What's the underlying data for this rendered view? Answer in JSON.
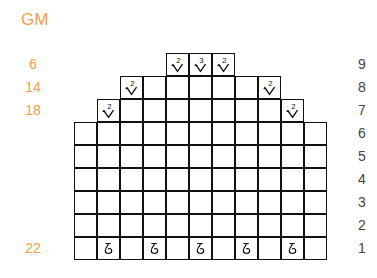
{
  "chart_title": "GM",
  "colors": {
    "label_orange": "#f0a04b",
    "grid": "#111111",
    "row_number": "#444444"
  },
  "grid": {
    "origin_x": 74,
    "bottom_y": 260,
    "cell": 23,
    "rows": [
      {
        "row": 1,
        "start_col": 0,
        "cols": 11,
        "left_count": "22",
        "symbols": {
          "1": "ch-loop",
          "3": "ch-loop",
          "5": "ch-loop",
          "7": "ch-loop",
          "9": "ch-loop"
        }
      },
      {
        "row": 2,
        "start_col": 0,
        "cols": 11,
        "left_count": "",
        "symbols": {}
      },
      {
        "row": 3,
        "start_col": 0,
        "cols": 11,
        "left_count": "",
        "symbols": {}
      },
      {
        "row": 4,
        "start_col": 0,
        "cols": 11,
        "left_count": "",
        "symbols": {}
      },
      {
        "row": 5,
        "start_col": 0,
        "cols": 11,
        "left_count": "",
        "symbols": {}
      },
      {
        "row": 6,
        "start_col": 0,
        "cols": 11,
        "left_count": "",
        "symbols": {}
      },
      {
        "row": 7,
        "start_col": 1,
        "cols": 9,
        "left_count": "18",
        "symbols": {
          "1": "dec-2",
          "9": "dec-2"
        }
      },
      {
        "row": 8,
        "start_col": 2,
        "cols": 7,
        "left_count": "14",
        "symbols": {
          "2": "dec-2",
          "8": "dec-2"
        }
      },
      {
        "row": 9,
        "start_col": 4,
        "cols": 3,
        "left_count": "6",
        "symbols": {
          "4": "dec-2",
          "5": "dec-3",
          "6": "dec-2"
        }
      }
    ]
  },
  "row_numbers": [
    "1",
    "2",
    "3",
    "4",
    "5",
    "6",
    "7",
    "8",
    "9"
  ],
  "symbol_legend": {
    "dec-2": {
      "label": "2",
      "shape": "v"
    },
    "dec-3": {
      "label": "3",
      "shape": "v"
    },
    "ch-loop": {
      "label": "ɗ",
      "shape": "loop"
    }
  }
}
